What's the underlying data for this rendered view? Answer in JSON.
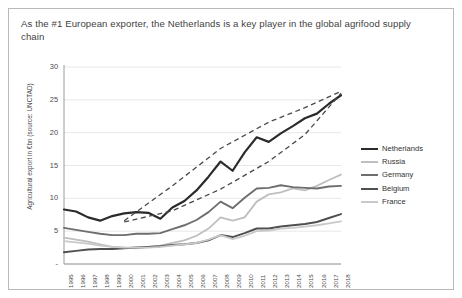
{
  "slide": {
    "title": "As the #1 European exporter, the Netherlands is a key player in the global agrifood supply chain"
  },
  "chart_data": {
    "type": "line",
    "title": "",
    "xlabel": "",
    "ylabel": "Agricultural export in €bn (source: UNCTAD)",
    "ylim": [
      0,
      30
    ],
    "yticks": [
      "-",
      "5",
      "10",
      "15",
      "20",
      "25",
      "30"
    ],
    "ytick_values": [
      0,
      5,
      10,
      15,
      20,
      25,
      30
    ],
    "grid": true,
    "legend_position": "right",
    "categories": [
      "1995",
      "1996",
      "1997",
      "1998",
      "1999",
      "2000",
      "2001",
      "2002",
      "2003",
      "2004",
      "2005",
      "2006",
      "2007",
      "2008",
      "2009",
      "2010",
      "2011",
      "2012",
      "2013",
      "2014",
      "2015",
      "2016",
      "2017",
      "2018"
    ],
    "series": [
      {
        "name": "Netherlands",
        "color": "#2b2b2b",
        "width": 2.2,
        "values": [
          8.3,
          8.0,
          7.1,
          6.6,
          7.3,
          7.7,
          7.9,
          7.8,
          6.9,
          8.6,
          9.6,
          11.2,
          13.3,
          15.6,
          14.2,
          17.0,
          19.3,
          18.6,
          19.9,
          21.0,
          22.2,
          22.9,
          24.4,
          25.7
        ]
      },
      {
        "name": "Russia",
        "color": "#bfbfbf",
        "width": 1.8,
        "values": [
          4.0,
          3.7,
          3.4,
          3.0,
          2.6,
          2.5,
          2.4,
          2.6,
          2.8,
          3.2,
          3.6,
          4.3,
          5.4,
          7.1,
          6.6,
          7.1,
          9.5,
          10.6,
          10.9,
          11.5,
          11.2,
          11.9,
          12.8,
          13.6
        ]
      },
      {
        "name": "Germany",
        "color": "#6e6e6e",
        "width": 1.9,
        "values": [
          5.5,
          5.2,
          4.9,
          4.6,
          4.4,
          4.4,
          4.6,
          4.6,
          4.7,
          5.3,
          5.9,
          6.7,
          7.9,
          9.5,
          8.5,
          10.1,
          11.5,
          11.6,
          12.0,
          11.7,
          11.6,
          11.5,
          11.8,
          11.9
        ]
      },
      {
        "name": "Belgium",
        "color": "#4f4f4f",
        "width": 2.0,
        "values": [
          1.8,
          2.0,
          2.2,
          2.3,
          2.3,
          2.4,
          2.5,
          2.6,
          2.7,
          2.9,
          3.0,
          3.2,
          3.6,
          4.4,
          4.1,
          4.7,
          5.4,
          5.4,
          5.7,
          5.9,
          6.1,
          6.4,
          7.0,
          7.6
        ]
      },
      {
        "name": "France",
        "color": "#c9c9c9",
        "width": 1.8,
        "values": [
          3.5,
          3.3,
          3.1,
          2.8,
          2.6,
          2.5,
          2.5,
          2.5,
          2.6,
          2.8,
          3.0,
          3.2,
          3.7,
          4.4,
          3.8,
          4.3,
          5.0,
          5.1,
          5.4,
          5.5,
          5.7,
          5.9,
          6.2,
          6.5
        ]
      }
    ],
    "annotations": [
      {
        "name": "upper-envelope",
        "style": "dashed",
        "color": "#4a4a4a",
        "points": [
          [
            2000,
            6.6
          ],
          [
            2004,
            11.9
          ],
          [
            2008,
            17.6
          ],
          [
            2012,
            21.6
          ],
          [
            2015,
            23.8
          ],
          [
            2018,
            26.3
          ]
        ]
      },
      {
        "name": "lower-envelope",
        "style": "dashed",
        "color": "#4a4a4a",
        "points": [
          [
            2000,
            6.4
          ],
          [
            2004,
            8.1
          ],
          [
            2008,
            11.4
          ],
          [
            2012,
            15.6
          ],
          [
            2015,
            19.7
          ],
          [
            2018,
            26.0
          ]
        ]
      }
    ]
  }
}
